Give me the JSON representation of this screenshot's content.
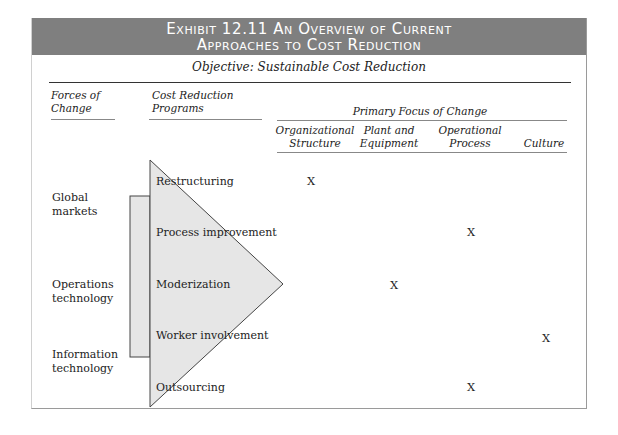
{
  "exhibit": {
    "title_line1": "Exhibit 12.11  An Overview of Current",
    "title_line2": "Approaches to Cost Reduction",
    "objective": "Objective: Sustainable Cost Reduction",
    "colors": {
      "band": "#7f7f7f",
      "shape_fill": "#e6e6e6",
      "shape_stroke": "#444444"
    }
  },
  "headers": {
    "forces_line1": "Forces of",
    "forces_line2": "Change",
    "programs_line1": "Cost Reduction",
    "programs_line2": "Programs",
    "primary_focus": "Primary Focus of Change",
    "focus_columns": [
      {
        "line1": "Organizational",
        "line2": "Structure"
      },
      {
        "line1": "Plant and",
        "line2": "Equipment"
      },
      {
        "line1": "Operational",
        "line2": "Process"
      },
      {
        "line1": "",
        "line2": "Culture"
      }
    ]
  },
  "forces": [
    {
      "line1": "Global",
      "line2": "markets"
    },
    {
      "line1": "Operations",
      "line2": "technology"
    },
    {
      "line1": "Information",
      "line2": "technology"
    }
  ],
  "programs": [
    {
      "label": "Restructuring",
      "mark": "X",
      "focus": "Organizational Structure"
    },
    {
      "label": "Process improvement",
      "mark": "X",
      "focus": "Operational Process"
    },
    {
      "label": "Moderization",
      "mark": "X",
      "focus": "Plant and Equipment"
    },
    {
      "label": "Worker involvement",
      "mark": "X",
      "focus": "Culture"
    },
    {
      "label": "Outsourcing",
      "mark": "X",
      "focus": "Operational Process"
    }
  ]
}
